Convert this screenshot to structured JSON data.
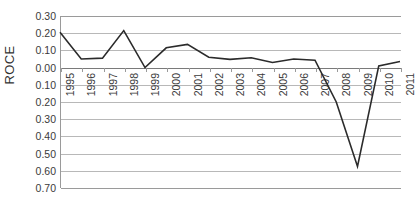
{
  "chart_data": {
    "type": "line",
    "title": "",
    "xlabel": "",
    "ylabel": "ROCE",
    "categories": [
      "1995",
      "1996",
      "1997",
      "1998",
      "1999",
      "2000",
      "2001",
      "2002",
      "2003",
      "2004",
      "2005",
      "2006",
      "2007",
      "2008",
      "2009",
      "2010",
      "2011"
    ],
    "values": [
      0.205,
      0.05,
      0.055,
      0.215,
      0.0,
      0.115,
      0.135,
      0.06,
      0.048,
      0.057,
      0.03,
      0.05,
      0.043,
      -0.2,
      -0.575,
      0.01,
      0.035
    ],
    "series": [
      {
        "name": "ROCE",
        "values": [
          0.205,
          0.05,
          0.055,
          0.215,
          0.0,
          0.115,
          0.135,
          0.06,
          0.048,
          0.057,
          0.03,
          0.05,
          0.043,
          -0.2,
          -0.575,
          0.01,
          0.035
        ]
      }
    ],
    "ylim": [
      -0.7,
      0.3
    ],
    "ytick_values": [
      0.3,
      0.2,
      0.1,
      0.0,
      -0.1,
      -0.2,
      -0.3,
      -0.4,
      -0.5,
      -0.6,
      -0.7
    ],
    "ytick_labels": [
      "0.30",
      "0.20",
      "0.10",
      "0.00",
      "0.10",
      "0.20",
      "0.30",
      "0.40",
      "0.50",
      "0.60",
      "0.70"
    ],
    "grid": true,
    "legend": "none",
    "line_color": "#2b2b2b",
    "grid_color": "#b8b8b8",
    "axis_color": "#9a9a9a"
  }
}
